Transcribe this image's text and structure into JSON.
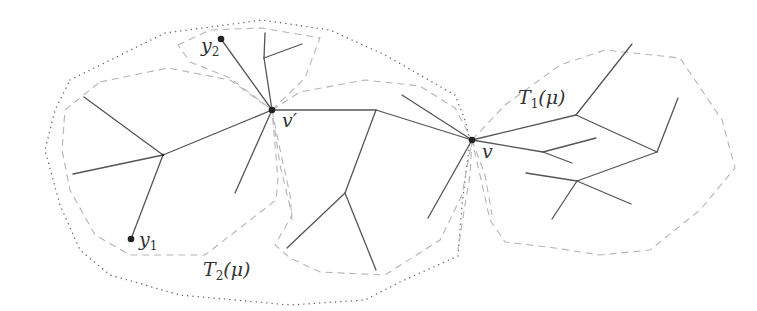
{
  "figure": {
    "labels": {
      "y1": "y",
      "y1_sub": "1",
      "y2": "y",
      "y2_sub": "2",
      "v_prime": "v′",
      "v": "v",
      "T1_main": "T",
      "T1_sub": "1",
      "T1_arg": "(μ)",
      "T2_main": "T",
      "T2_sub": "2",
      "T2_arg": "(μ)"
    },
    "nodes": [
      {
        "id": "v_prime",
        "x": 272,
        "y": 110,
        "marked": true
      },
      {
        "id": "v",
        "x": 472,
        "y": 140,
        "marked": true
      },
      {
        "id": "y1",
        "x": 131,
        "y": 239,
        "marked": true
      },
      {
        "id": "y2",
        "x": 221,
        "y": 39,
        "marked": true
      }
    ],
    "regions": [
      {
        "id": "T1",
        "style": "dashed",
        "label": "T1(μ)"
      },
      {
        "id": "T2",
        "style": "dotted",
        "label": "T2(μ)"
      }
    ],
    "colors": {
      "edge": "#555555",
      "dashed": "#b5b5b5",
      "dotted": "#666666",
      "vertex": "#222222"
    }
  }
}
